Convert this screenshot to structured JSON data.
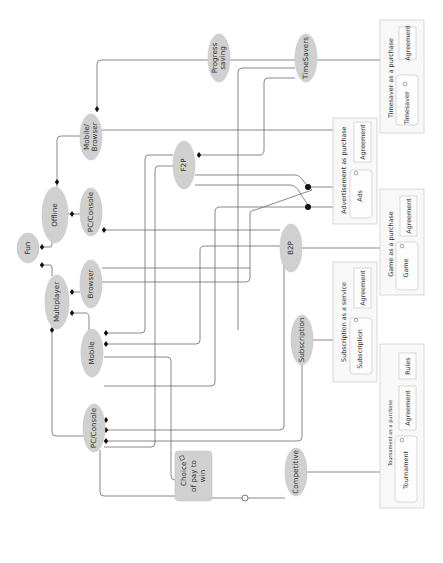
{
  "diagram": {
    "orientation": "rotated-90-ccw",
    "nodes": {
      "fun": "Fun",
      "offline": "Offline",
      "multiplayer": "Multiplayer",
      "mobile_browser": [
        "Mobile/",
        "Browser"
      ],
      "pc_console_offline": "PC/Console",
      "browser": "Browser",
      "mobile": "Mobile",
      "pc_console_multi": "PC/Console",
      "progress_saving": [
        "Progress",
        "saving"
      ],
      "timesavers": "TimeSavers",
      "f2p": "F2P",
      "b2p": "B2P",
      "subscription": "Subscription",
      "competitive": "Competitive",
      "choice": [
        "Choice",
        "of pay to",
        "win"
      ]
    },
    "panels": {
      "timesaver": {
        "title": "Timesaver as a purchase",
        "item": "Timesaver",
        "agreement": "Agreement"
      },
      "advertisement": {
        "title": "Advertisement as purchase",
        "item": "Ads",
        "agreement": "Agreement"
      },
      "game": {
        "title": "Game as a purchase",
        "item": "Game",
        "agreement": "Agreement"
      },
      "subscription": {
        "title": "Subscription as a service",
        "item": "Subscription",
        "agreement": "Agreement"
      },
      "tournament": {
        "title": "Tournament as a purchase",
        "item": "Tournament",
        "agreement": "Agreement",
        "rules": "Rules"
      }
    },
    "colors": {
      "node_fill": "#d0d0d0",
      "edge": "#6b6b6b",
      "panel_border": "#cfcfcf"
    }
  }
}
